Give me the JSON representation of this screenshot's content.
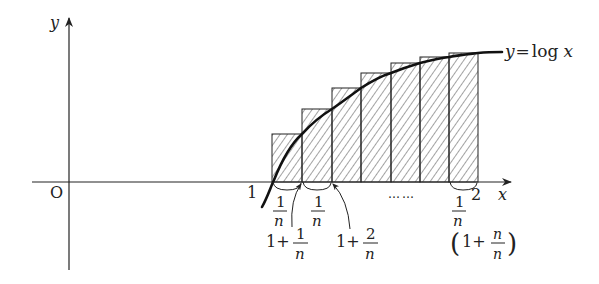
{
  "diagram": {
    "axes": {
      "x_label": "x",
      "y_label": "y",
      "origin_label": "O"
    },
    "curve": {
      "label_y": "y",
      "label_eq": "=",
      "label_fn": "log",
      "label_var": "x"
    },
    "x_ticks": {
      "one": "1",
      "two": "2",
      "dots": "……"
    },
    "intervals": [
      {
        "num": "1",
        "den": "n"
      },
      {
        "num": "1",
        "den": "n"
      },
      {
        "num": "1",
        "den": "n"
      }
    ],
    "points": [
      {
        "lead": "1+",
        "num": "1",
        "den": "n"
      },
      {
        "lead": "1+",
        "num": "2",
        "den": "n"
      },
      {
        "lead": "1+",
        "num": "n",
        "den": "n",
        "paren_open": "(",
        "paren_close": ")"
      }
    ],
    "rectangles": {
      "count": 7,
      "x_edges_px": [
        272,
        302,
        332,
        361,
        391,
        420,
        449,
        478
      ],
      "tops_px": [
        134,
        109,
        88,
        73,
        63,
        57,
        53
      ],
      "fill": "hatched"
    },
    "colors": {
      "ink": "#222222",
      "background": "#ffffff"
    }
  }
}
